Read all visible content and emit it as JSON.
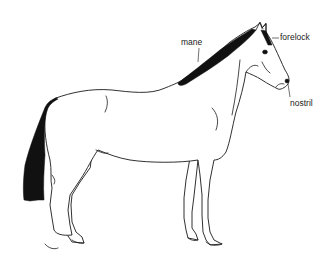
{
  "diagram": {
    "labels": [
      {
        "id": "mane",
        "text": "mane"
      },
      {
        "id": "forelock",
        "text": "forelock"
      },
      {
        "id": "nostril",
        "text": "nostril"
      }
    ],
    "colors": {
      "background": "#ffffff",
      "ink": "#1a1a1a",
      "hair": "#111111"
    }
  }
}
